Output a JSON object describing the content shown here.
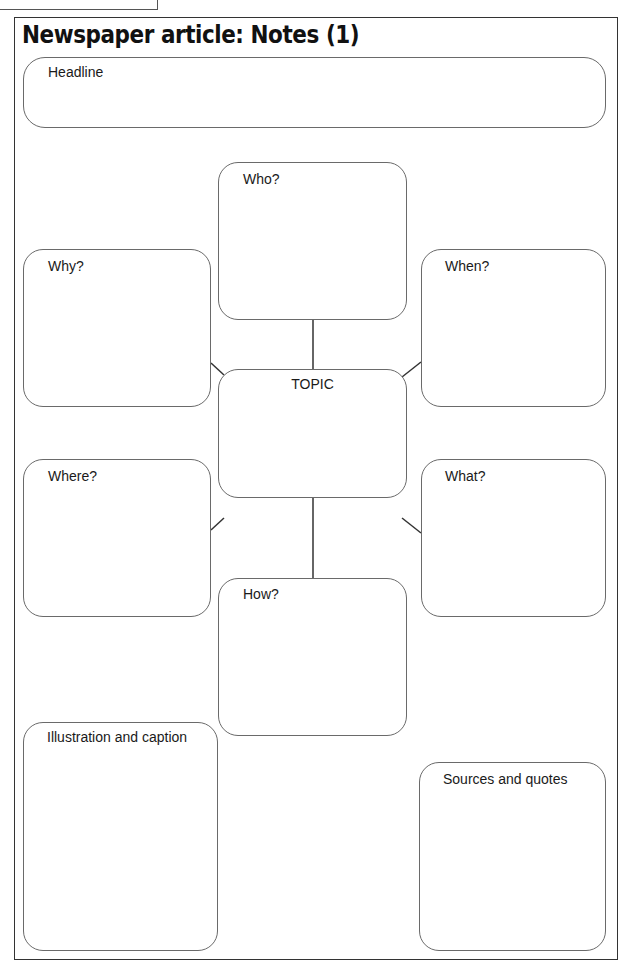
{
  "header_tab": {
    "text": ""
  },
  "title": "Newspaper article: Notes (1)",
  "boxes": {
    "headline": {
      "label": "Headline"
    },
    "who": {
      "label": "Who?"
    },
    "why": {
      "label": "Why?"
    },
    "when": {
      "label": "When?"
    },
    "topic": {
      "label": "TOPIC"
    },
    "where": {
      "label": "Where?"
    },
    "what": {
      "label": "What?"
    },
    "how": {
      "label": "How?"
    },
    "illustration": {
      "label": "Illustration and caption"
    },
    "sources": {
      "label": "Sources and quotes"
    }
  },
  "colors": {
    "border": "#333333",
    "box_border": "#6a6a6a",
    "connector": "#333333"
  }
}
